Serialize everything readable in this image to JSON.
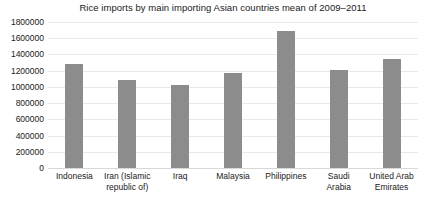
{
  "chart_data": {
    "type": "bar",
    "title": "Rice imports by main importing Asian countries mean of 2009–2011",
    "xlabel": "",
    "ylabel": "",
    "categories": [
      "Indonesia",
      "Iran (Islamic republic of)",
      "Iraq",
      "Malaysia",
      "Philippines",
      "Saudi Arabia",
      "United Arab Emirates"
    ],
    "values": [
      1280000,
      1085000,
      1025000,
      1175000,
      1690000,
      1210000,
      1345000
    ],
    "ylim": [
      0,
      1800000
    ],
    "ytick_labels": [
      "1800000",
      "1600000",
      "1400000",
      "1200000",
      "1000000",
      "800000",
      "600000",
      "400000",
      "200000",
      "0"
    ],
    "ytick_values": [
      1800000,
      1600000,
      1400000,
      1200000,
      1000000,
      800000,
      600000,
      400000,
      200000,
      0
    ],
    "grid": true,
    "legend": null,
    "bar_color": "#8c8c8c",
    "grid_color": "#e9e9e9",
    "background_color": "#ffffff",
    "text_color": "#1a1a1a"
  },
  "x_label_lines": [
    [
      "Indonesia"
    ],
    [
      "Iran (Islamic",
      "republic of)"
    ],
    [
      "Iraq"
    ],
    [
      "Malaysia"
    ],
    [
      "Philippines"
    ],
    [
      "Saudi",
      "Arabia"
    ],
    [
      "United Arab",
      "Emirates"
    ]
  ]
}
